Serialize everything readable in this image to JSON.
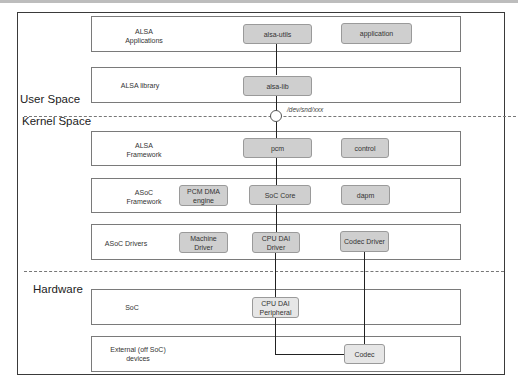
{
  "sections": {
    "user_space": "User Space",
    "kernel_space": "Kernel Space",
    "hardware": "Hardware"
  },
  "rows": [
    {
      "label": "ALSA\nApplications",
      "label_lines": [
        "ALSA",
        "Applications"
      ]
    },
    {
      "label": "ALSA library",
      "label_lines": [
        "ALSA library"
      ]
    },
    {
      "label": "ALSA\nFramework",
      "label_lines": [
        "ALSA",
        "Framework"
      ]
    },
    {
      "label": "ASoC\nFramework",
      "label_lines": [
        "ASoC",
        "Framework"
      ]
    },
    {
      "label": "ASoC Drivers",
      "label_lines": [
        "ASoC Drivers"
      ]
    },
    {
      "label": "SoC",
      "label_lines": [
        "SoC"
      ]
    },
    {
      "label": "External (off SoC)\ndevices",
      "label_lines": [
        "External (off SoC)",
        "devices"
      ]
    }
  ],
  "components": {
    "alsa_utils": "alsa-utils",
    "application": "application",
    "alsa_lib": "alsa-lib",
    "pcm": "pcm",
    "control": "control",
    "pcm_dma_engine": [
      "PCM DMA",
      "engine"
    ],
    "soc_core": "SoC Core",
    "dapm": "dapm",
    "machine_driver": [
      "Machine",
      "Driver"
    ],
    "cpu_dai_driver": [
      "CPU DAI",
      "Driver"
    ],
    "codec_driver": "Codec Driver",
    "cpu_dai_peripheral": [
      "CPU DAI",
      "Peripheral"
    ],
    "codec": "Codec"
  },
  "interface": {
    "device_node": "/dev/snd/xxx"
  },
  "colors": {
    "component_fill": "#cfcfcf",
    "hardware_component_fill": "#e6e6e6",
    "connector": "#222222",
    "row_border": "#7a7a7a"
  }
}
